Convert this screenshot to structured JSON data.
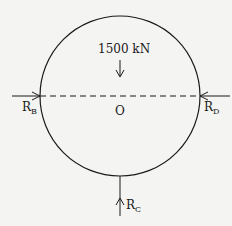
{
  "diagram": {
    "load": {
      "label": "1500 kN",
      "direction": "down"
    },
    "center": {
      "label": "O"
    },
    "reactions": [
      {
        "name": "R",
        "sub": "B",
        "direction": "right"
      },
      {
        "name": "R",
        "sub": "D",
        "direction": "left"
      },
      {
        "name": "R",
        "sub": "C",
        "direction": "up"
      }
    ],
    "colors": {
      "line": "#1a1a1a",
      "background": "#f4f4f2"
    }
  }
}
